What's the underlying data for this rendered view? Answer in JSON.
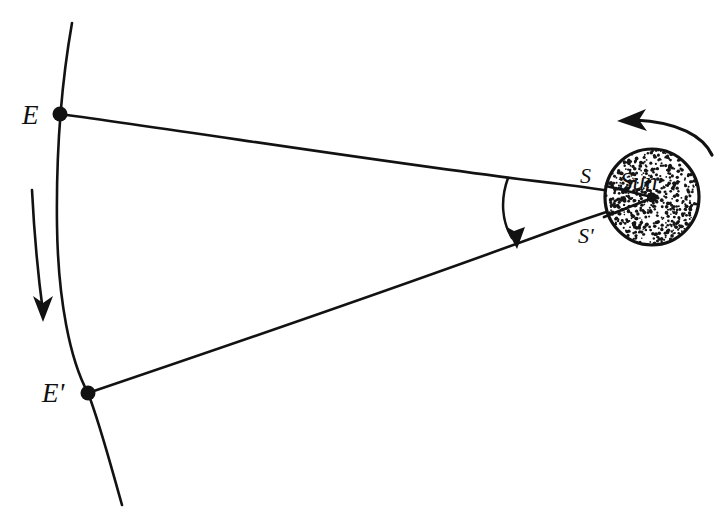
{
  "figure": {
    "background_color": "#ffffff",
    "ink_color": "#121212",
    "width": 728,
    "height": 532
  },
  "labels": {
    "earth_first": "E",
    "earth_second": "E'",
    "sun_point_first": "S",
    "sun_point_second": "S'",
    "sun_body": "Sun"
  },
  "points": {
    "E": {
      "x": 60,
      "y": 114
    },
    "Eprime": {
      "x": 88,
      "y": 393
    },
    "S": {
      "x": 608,
      "y": 188
    },
    "Sprime": {
      "x": 606,
      "y": 216
    },
    "sun_center": {
      "x": 652,
      "y": 198
    }
  },
  "sun": {
    "center_x": 652,
    "center_y": 197,
    "radius_x": 48,
    "radius_y": 49,
    "stipple": true,
    "stipple_count": 560,
    "center_dot_radius": 5
  },
  "orbit_arc": {
    "description": "Earth's orbital arc, curving left then right",
    "start": {
      "x": 72,
      "y": 23
    },
    "end": {
      "x": 122,
      "y": 505
    },
    "bulge_direction": "left"
  },
  "arrows": {
    "orbit_motion": {
      "name": "earth-orbit-direction-arrow",
      "direction": "down",
      "start": {
        "x": 32,
        "y": 190
      },
      "end": {
        "x": 43,
        "y": 318
      }
    },
    "sun_rotation": {
      "name": "sun-rotation-arrow",
      "direction": "counterclockwise / leftward",
      "start": {
        "x": 710,
        "y": 152
      },
      "end": {
        "x": 619,
        "y": 122
      }
    },
    "angle_marker": {
      "name": "parallax-angle-arc",
      "direction": "down",
      "start": {
        "x": 508,
        "y": 178
      },
      "end": {
        "x": 516,
        "y": 243
      }
    }
  },
  "sight_lines": [
    {
      "name": "E-to-S",
      "from": "E",
      "to": "sun_center"
    },
    {
      "name": "Ep-to-Sp",
      "from": "Eprime",
      "to": "sun_center"
    }
  ],
  "label_positions": {
    "E": {
      "x": 22,
      "y": 124
    },
    "Eprime": {
      "x": 44,
      "y": 401
    },
    "S": {
      "x": 580,
      "y": 184
    },
    "Sprime": {
      "x": 580,
      "y": 243
    },
    "sun": {
      "x": 620,
      "y": 192
    }
  },
  "ghost_marks": {
    "visible": false,
    "note": "faint scanner bleed-through near page bottom"
  }
}
